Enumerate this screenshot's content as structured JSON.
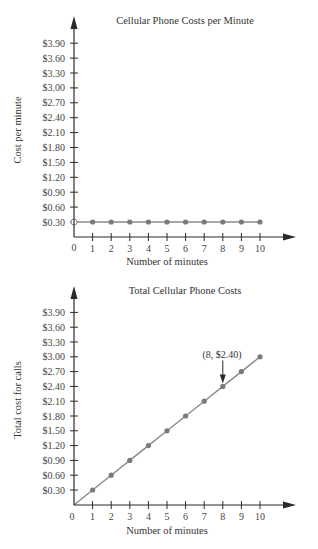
{
  "chart_data": [
    {
      "type": "line",
      "title": "Cellular Phone Costs per Minute",
      "xlabel": "Number of minutes",
      "ylabel": "Cost per minute",
      "x": [
        0,
        1,
        2,
        3,
        4,
        5,
        6,
        7,
        8,
        9,
        10
      ],
      "x_ticks": [
        "0",
        "1",
        "2",
        "3",
        "4",
        "5",
        "6",
        "7",
        "8",
        "9",
        "10"
      ],
      "y_ticks": [
        "$0.30",
        "$0.60",
        "$0.90",
        "$1.20",
        "$1.50",
        "$1.80",
        "$2.10",
        "$2.40",
        "$2.70",
        "$3.00",
        "$3.30",
        "$3.60",
        "$3.90"
      ],
      "series": [
        {
          "name": "Cost per minute",
          "values": [
            0.3,
            0.3,
            0.3,
            0.3,
            0.3,
            0.3,
            0.3,
            0.3,
            0.3,
            0.3,
            0.3
          ]
        }
      ],
      "open_point": {
        "x": 0,
        "y": 0.3
      },
      "xlim": [
        0,
        10
      ],
      "ylim": [
        0,
        3.9
      ],
      "grid": false
    },
    {
      "type": "line",
      "title": "Total Cellular Phone Costs",
      "xlabel": "Number of minutes",
      "ylabel": "Total cost for calls",
      "x": [
        0,
        1,
        2,
        3,
        4,
        5,
        6,
        7,
        8,
        9,
        10
      ],
      "x_ticks": [
        "0",
        "1",
        "2",
        "3",
        "4",
        "5",
        "6",
        "7",
        "8",
        "9",
        "10"
      ],
      "y_ticks": [
        "$0.30",
        "$0.60",
        "$0.90",
        "$1.20",
        "$1.50",
        "$1.80",
        "$2.10",
        "$2.40",
        "$2.70",
        "$3.00",
        "$3.30",
        "$3.60",
        "$3.90"
      ],
      "series": [
        {
          "name": "Total cost",
          "values": [
            0,
            0.3,
            0.6,
            0.9,
            1.2,
            1.5,
            1.8,
            2.1,
            2.4,
            2.7,
            3.0
          ]
        }
      ],
      "annotations": [
        {
          "text": "(8, $2.40)",
          "x": 8,
          "y": 2.4,
          "arrow": true
        }
      ],
      "xlim": [
        0,
        10
      ],
      "ylim": [
        0,
        3.9
      ],
      "grid": false
    }
  ],
  "charts": [
    {
      "title": "Cellular Phone Costs per Minute",
      "xlabel": "Number of minutes",
      "ylabel": "Cost per minute",
      "origin_label": "0"
    },
    {
      "title": "Total Cellular Phone Costs",
      "xlabel": "Number of minutes",
      "ylabel": "Total cost for calls",
      "origin_label": "0",
      "annotation": "(8, $2.40)"
    }
  ],
  "colors": {
    "axis": "#2a2a2a",
    "line": "#8a8a8a",
    "point": "#7a7a7a",
    "text": "#333333"
  }
}
